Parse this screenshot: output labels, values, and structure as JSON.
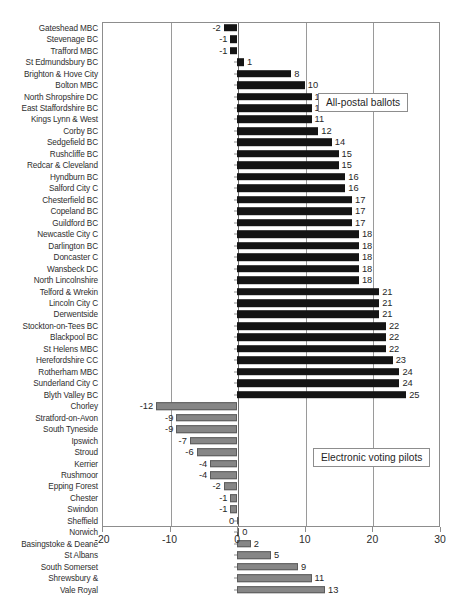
{
  "chart_data": {
    "type": "bar",
    "orientation": "horizontal",
    "title": "",
    "xlabel": "",
    "ylabel": "",
    "xlim": [
      -20,
      30
    ],
    "xticks": [
      -20,
      -10,
      0,
      10,
      20,
      30
    ],
    "grid": true,
    "legend_position": "inside-right",
    "series": [
      {
        "name": "All-postal ballots",
        "color": "#141414",
        "categories": [
          "Gateshead MBC",
          "Stevenage BC",
          "Trafford MBC",
          "St Edmundsbury BC",
          "Brighton & Hove City",
          "Bolton MBC",
          "North Shropshire DC",
          "East Staffordshire BC",
          "Kings Lynn & West",
          "Corby BC",
          "Sedgefield BC",
          "Rushcliffe BC",
          "Redcar & Cleveland",
          "Hyndburn BC",
          "Salford City C",
          "Chesterfield BC",
          "Copeland BC",
          "Guildford BC",
          "Newcastle City C",
          "Darlington BC",
          "Doncaster C",
          "Wansbeck DC",
          "North Lincolnshire",
          "Telford & Wrekin",
          "Lincoln City C",
          "Derwentside",
          "Stockton-on-Tees BC",
          "Blackpool BC",
          "St Helens MBC",
          "Herefordshire CC",
          "Rotherham MBC",
          "Sunderland City C",
          "Blyth Valley BC"
        ],
        "values": [
          -2,
          -1,
          -1,
          1,
          8,
          10,
          11,
          11,
          11,
          12,
          14,
          15,
          15,
          16,
          16,
          17,
          17,
          17,
          18,
          18,
          18,
          18,
          18,
          21,
          21,
          21,
          22,
          22,
          22,
          23,
          24,
          24,
          25
        ]
      },
      {
        "name": "Electronic voting pilots",
        "color": "#868686",
        "categories": [
          "Chorley",
          "Stratford-on-Avon",
          "South Tyneside",
          "Ipswich",
          "Stroud",
          "Kerrier",
          "Rushmoor",
          "Epping Forest",
          "Chester",
          "Swindon",
          "Sheffield",
          "Norwich",
          "Basingstoke & Deane",
          "St Albans",
          "South Somerset",
          "Shrewsbury &",
          "Vale Royal"
        ],
        "values": [
          -12,
          -9,
          -9,
          -7,
          -6,
          -4,
          -4,
          -2,
          -1,
          -1,
          0,
          0,
          2,
          5,
          9,
          11,
          13
        ]
      }
    ]
  },
  "legends": {
    "postal": "All-postal ballots",
    "epilot": "Electronic voting pilots"
  }
}
